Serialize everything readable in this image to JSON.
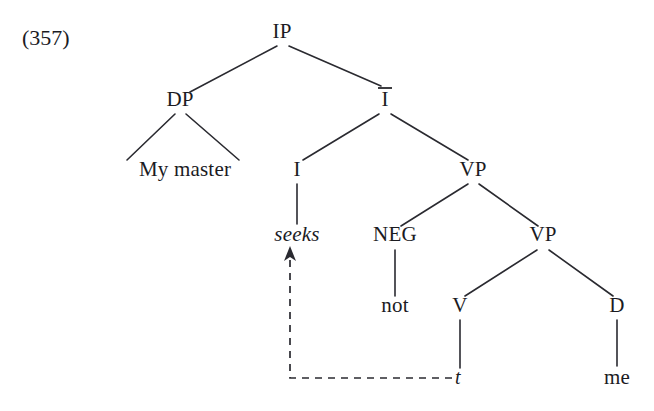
{
  "figure": {
    "example_number": "(357)",
    "type": "syntax-tree",
    "sentence": "My master seeks not me",
    "background_color": "#ffffff",
    "line_color": "#2a2a30",
    "text_color": "#1b1b1f"
  },
  "nodes": [
    {
      "id": "ip",
      "label": "IP",
      "x": 282,
      "y": 38,
      "bar": false,
      "italic": false,
      "kind": "phrase"
    },
    {
      "id": "dp",
      "label": "DP",
      "x": 180,
      "y": 106,
      "bar": false,
      "italic": false,
      "kind": "phrase"
    },
    {
      "id": "ibar",
      "label": "I",
      "x": 385,
      "y": 106,
      "bar": true,
      "italic": false,
      "kind": "bar"
    },
    {
      "id": "mymaster",
      "label": "My master",
      "x": 185,
      "y": 176,
      "bar": false,
      "italic": false,
      "kind": "terminal"
    },
    {
      "id": "i",
      "label": "I",
      "x": 297,
      "y": 176,
      "bar": false,
      "italic": false,
      "kind": "head"
    },
    {
      "id": "vp1",
      "label": "VP",
      "x": 473,
      "y": 176,
      "bar": false,
      "italic": false,
      "kind": "phrase"
    },
    {
      "id": "seeks",
      "label": "seeks",
      "x": 297,
      "y": 241,
      "bar": false,
      "italic": true,
      "kind": "terminal"
    },
    {
      "id": "neg",
      "label": "NEG",
      "x": 395,
      "y": 241,
      "bar": false,
      "italic": false,
      "kind": "head"
    },
    {
      "id": "vp2",
      "label": "VP",
      "x": 543,
      "y": 241,
      "bar": false,
      "italic": false,
      "kind": "phrase"
    },
    {
      "id": "not",
      "label": "not",
      "x": 395,
      "y": 312,
      "bar": false,
      "italic": false,
      "kind": "terminal"
    },
    {
      "id": "v",
      "label": "V",
      "x": 460,
      "y": 312,
      "bar": false,
      "italic": false,
      "kind": "head"
    },
    {
      "id": "d",
      "label": "D",
      "x": 617,
      "y": 312,
      "bar": false,
      "italic": false,
      "kind": "head"
    },
    {
      "id": "trace",
      "label": "t",
      "x": 458,
      "y": 384,
      "bar": false,
      "italic": true,
      "kind": "trace"
    },
    {
      "id": "me",
      "label": "me",
      "x": 617,
      "y": 384,
      "bar": false,
      "italic": false,
      "kind": "terminal"
    }
  ],
  "edges": [
    {
      "from": "ip",
      "to": "dp",
      "x1": 277,
      "y1": 46,
      "x2": 190,
      "y2": 92
    },
    {
      "from": "ip",
      "to": "ibar",
      "x1": 289,
      "y1": 46,
      "x2": 381,
      "y2": 86
    },
    {
      "from": "dp",
      "to": "my",
      "x1": 175,
      "y1": 114,
      "x2": 127,
      "y2": 160
    },
    {
      "from": "dp",
      "to": "master",
      "x1": 186,
      "y1": 114,
      "x2": 239,
      "y2": 160
    },
    {
      "from": "ibar",
      "to": "i",
      "x1": 379,
      "y1": 114,
      "x2": 303,
      "y2": 160
    },
    {
      "from": "ibar",
      "to": "vp1",
      "x1": 391,
      "y1": 114,
      "x2": 468,
      "y2": 160
    },
    {
      "from": "i",
      "to": "seeks",
      "x1": 297,
      "y1": 184,
      "x2": 297,
      "y2": 224
    },
    {
      "from": "vp1",
      "to": "neg",
      "x1": 468,
      "y1": 184,
      "x2": 401,
      "y2": 226
    },
    {
      "from": "vp1",
      "to": "vp2",
      "x1": 479,
      "y1": 184,
      "x2": 538,
      "y2": 226
    },
    {
      "from": "neg",
      "to": "not",
      "x1": 395,
      "y1": 250,
      "x2": 395,
      "y2": 296
    },
    {
      "from": "vp2",
      "to": "v",
      "x1": 537,
      "y1": 250,
      "x2": 465,
      "y2": 296
    },
    {
      "from": "vp2",
      "to": "d",
      "x1": 549,
      "y1": 250,
      "x2": 613,
      "y2": 296
    },
    {
      "from": "v",
      "to": "trace",
      "x1": 460,
      "y1": 320,
      "x2": 460,
      "y2": 368
    },
    {
      "from": "d",
      "to": "me",
      "x1": 617,
      "y1": 320,
      "x2": 617,
      "y2": 366
    }
  ],
  "movement": {
    "description": "head movement from V trace to I",
    "from_node": "trace",
    "to_node": "seeks",
    "path": "M 452 378 L 290 378 L 290 258",
    "arrow_points": "290,246 296,261 290,257 284,261",
    "style": "dashed"
  }
}
